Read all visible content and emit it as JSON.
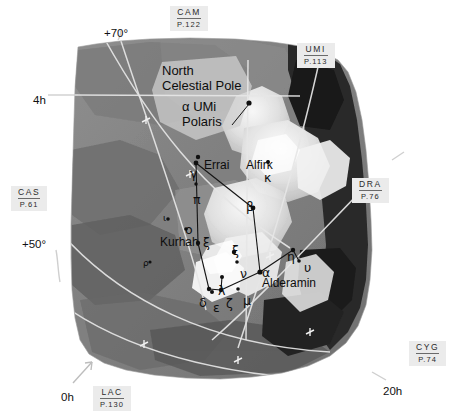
{
  "chart": {
    "title_block": "North Celestial Pole",
    "pole_label_lines": [
      "North",
      "Celestial Pole"
    ],
    "polaris_lines": [
      "α UMi",
      "Polaris"
    ],
    "background_color": "#ffffff",
    "grid_color": "#e8e8e8",
    "star_color": "#101010"
  },
  "coordinates": [
    {
      "name": "dec-plus-70",
      "label": "+70°",
      "x": 104,
      "y": 27
    },
    {
      "name": "ra-4h",
      "label": "4h",
      "x": 33,
      "y": 94
    },
    {
      "name": "dec-plus-50",
      "label": "+50°",
      "x": 22,
      "y": 238
    },
    {
      "name": "ra-0h",
      "label": "0h",
      "x": 61,
      "y": 391
    },
    {
      "name": "ra-20h",
      "label": "20h",
      "x": 383,
      "y": 385
    }
  ],
  "reference_labels": [
    {
      "name": "ref-cam",
      "abbr": "CAM",
      "page": "P.122",
      "x": 170,
      "y": 6
    },
    {
      "name": "ref-umi",
      "abbr": "UMI",
      "page": "P.113",
      "x": 297,
      "y": 43
    },
    {
      "name": "ref-dra",
      "abbr": "DRA",
      "page": "P.76",
      "x": 352,
      "y": 178
    },
    {
      "name": "ref-cas",
      "abbr": "CAS",
      "page": "P.61",
      "x": 11,
      "y": 186
    },
    {
      "name": "ref-cyg",
      "abbr": "CYG",
      "page": "P.74",
      "x": 409,
      "y": 341
    },
    {
      "name": "ref-lac",
      "abbr": "LAC",
      "page": "P.130",
      "x": 93,
      "y": 386
    }
  ],
  "star_names": [
    {
      "name": "star-name-errai",
      "label": "Errai",
      "x": 204,
      "y": 158
    },
    {
      "name": "star-name-alfirk",
      "label": "Alfirk",
      "x": 246,
      "y": 158
    },
    {
      "name": "star-name-kurhah",
      "label": "Kurhah",
      "x": 160,
      "y": 235
    },
    {
      "name": "star-name-alderamin",
      "label": "Alderamin",
      "x": 262,
      "y": 276
    }
  ],
  "greek_labels": [
    {
      "name": "greek-gamma",
      "label": "γ",
      "x": 190,
      "y": 166
    },
    {
      "name": "greek-pi",
      "label": "π",
      "x": 193,
      "y": 192
    },
    {
      "name": "greek-kappa",
      "label": "κ",
      "x": 264,
      "y": 170
    },
    {
      "name": "greek-beta",
      "label": "β",
      "x": 246,
      "y": 199
    },
    {
      "name": "greek-omicron",
      "label": "ο",
      "x": 185,
      "y": 222
    },
    {
      "name": "greek-xi-kurhah",
      "label": "ξ",
      "x": 203,
      "y": 235
    },
    {
      "name": "greek-xi",
      "label": "ξ",
      "x": 232,
      "y": 243
    },
    {
      "name": "greek-nu",
      "label": "ν",
      "x": 240,
      "y": 266
    },
    {
      "name": "greek-alpha",
      "label": "α",
      "x": 262,
      "y": 265
    },
    {
      "name": "greek-eta",
      "label": "η",
      "x": 287,
      "y": 249
    },
    {
      "name": "greek-upsilon",
      "label": "υ",
      "x": 304,
      "y": 260
    },
    {
      "name": "greek-lambda",
      "label": "λ",
      "x": 218,
      "y": 283
    },
    {
      "name": "greek-delta",
      "label": "δ",
      "x": 199,
      "y": 295
    },
    {
      "name": "greek-epsilon",
      "label": "ε",
      "x": 213,
      "y": 300
    },
    {
      "name": "greek-zeta",
      "label": "ζ",
      "x": 226,
      "y": 296
    },
    {
      "name": "greek-mu",
      "label": "μ",
      "x": 243,
      "y": 293
    },
    {
      "name": "greek-iota-small",
      "label": "ι",
      "x": 163,
      "y": 213
    },
    {
      "name": "greek-rho-small",
      "label": "ρ",
      "x": 143,
      "y": 258
    }
  ],
  "stars": [
    {
      "name": "star-polaris",
      "x": 249,
      "y": 103,
      "r": 2.6
    },
    {
      "name": "star-gamma",
      "x": 196,
      "y": 163,
      "r": 2.4
    },
    {
      "name": "star-errai-dot",
      "x": 198,
      "y": 157,
      "r": 2.2
    },
    {
      "name": "star-pi",
      "x": 196,
      "y": 184,
      "r": 1.7
    },
    {
      "name": "star-kappa",
      "x": 268,
      "y": 162,
      "r": 2.0
    },
    {
      "name": "star-beta",
      "x": 253,
      "y": 208,
      "r": 2.4
    },
    {
      "name": "star-omicron",
      "x": 186,
      "y": 229,
      "r": 1.8
    },
    {
      "name": "star-xi-kurhah",
      "x": 198,
      "y": 243,
      "r": 2.2
    },
    {
      "name": "star-xi",
      "x": 234,
      "y": 252,
      "r": 2.2
    },
    {
      "name": "star-nu",
      "x": 237,
      "y": 262,
      "r": 1.8
    },
    {
      "name": "star-alpha",
      "x": 260,
      "y": 272,
      "r": 2.6
    },
    {
      "name": "star-eta",
      "x": 293,
      "y": 250,
      "r": 2.2
    },
    {
      "name": "star-upsilon",
      "x": 299,
      "y": 261,
      "r": 1.8
    },
    {
      "name": "star-lambda",
      "x": 222,
      "y": 277,
      "r": 2.0
    },
    {
      "name": "star-delta",
      "x": 209,
      "y": 289,
      "r": 2.2
    },
    {
      "name": "star-epsilon",
      "x": 212,
      "y": 292,
      "r": 2.0
    },
    {
      "name": "star-zeta",
      "x": 221,
      "y": 290,
      "r": 2.2
    },
    {
      "name": "star-mu",
      "x": 238,
      "y": 289,
      "r": 1.8
    },
    {
      "name": "star-iota",
      "x": 168,
      "y": 219,
      "r": 1.8
    },
    {
      "name": "star-rho",
      "x": 150,
      "y": 262,
      "r": 1.6
    }
  ],
  "constellation_lines": [
    {
      "name": "line-gamma-beta",
      "x1": 196,
      "y1": 163,
      "x2": 253,
      "y2": 208
    },
    {
      "name": "line-gamma-xi",
      "x1": 196,
      "y1": 163,
      "x2": 198,
      "y2": 243
    },
    {
      "name": "line-beta-alpha",
      "x1": 253,
      "y1": 208,
      "x2": 260,
      "y2": 272
    },
    {
      "name": "line-xi-delta",
      "x1": 198,
      "y1": 243,
      "x2": 209,
      "y2": 289
    },
    {
      "name": "line-alpha-eta",
      "x1": 260,
      "y1": 272,
      "x2": 293,
      "y2": 250
    },
    {
      "name": "line-eta-upsilon",
      "x1": 293,
      "y1": 250,
      "x2": 299,
      "y2": 261
    },
    {
      "name": "line-alpha-zeta",
      "x1": 260,
      "y1": 272,
      "x2": 221,
      "y2": 290
    },
    {
      "name": "line-zeta-delta",
      "x1": 221,
      "y1": 290,
      "x2": 209,
      "y2": 289
    },
    {
      "name": "line-lambda-zeta",
      "x1": 222,
      "y1": 277,
      "x2": 221,
      "y2": 290
    }
  ],
  "pole_marker": {
    "name": "pole-pointer",
    "x1": 232,
    "y1": 125,
    "x2": 249,
    "y2": 104
  }
}
